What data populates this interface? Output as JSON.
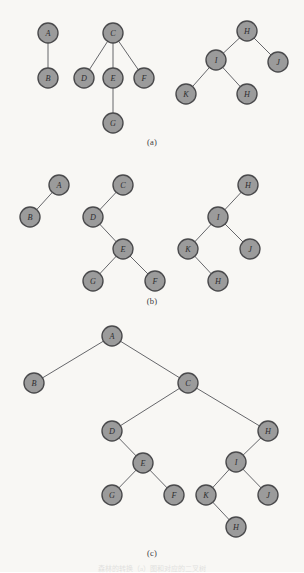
{
  "figure": {
    "background_color": "#f8f7f4",
    "node_fill": "#9b9b9b",
    "node_stroke": "#4a4a4c",
    "edge_color": "#55565a",
    "node_radius": 10,
    "caption_bottom": "森林的转换（a）图和对应的二叉树"
  },
  "panels": [
    {
      "id": "a",
      "caption": "(a)",
      "caption_y": 137,
      "description": "forest of three general trees",
      "trees": [
        {
          "id": "a-tree-1",
          "nodes": [
            {
              "label": "A",
              "x": 48,
              "y": 33
            },
            {
              "label": "B",
              "x": 48,
              "y": 78
            }
          ],
          "edges": [
            [
              0,
              1
            ]
          ]
        },
        {
          "id": "a-tree-2",
          "nodes": [
            {
              "label": "C",
              "x": 113,
              "y": 33
            },
            {
              "label": "D",
              "x": 84,
              "y": 78
            },
            {
              "label": "E",
              "x": 113,
              "y": 78
            },
            {
              "label": "F",
              "x": 144,
              "y": 78
            },
            {
              "label": "G",
              "x": 113,
              "y": 123
            }
          ],
          "edges": [
            [
              0,
              1
            ],
            [
              0,
              2
            ],
            [
              0,
              3
            ],
            [
              2,
              4
            ]
          ]
        },
        {
          "id": "a-tree-3",
          "nodes": [
            {
              "label": "H",
              "x": 247,
              "y": 31
            },
            {
              "label": "I",
              "x": 216,
              "y": 60
            },
            {
              "label": "J",
              "x": 278,
              "y": 62
            },
            {
              "label": "K",
              "x": 186,
              "y": 94
            },
            {
              "label": "H",
              "x": 247,
              "y": 94
            }
          ],
          "edges": [
            [
              0,
              1
            ],
            [
              0,
              2
            ],
            [
              1,
              3
            ],
            [
              1,
              4
            ]
          ]
        }
      ]
    },
    {
      "id": "b",
      "caption": "(b)",
      "caption_y": 296,
      "description": "each tree converted to a binary tree",
      "trees": [
        {
          "id": "b-tree-1",
          "nodes": [
            {
              "label": "A",
              "x": 59,
              "y": 185
            },
            {
              "label": "B",
              "x": 30,
              "y": 217
            }
          ],
          "edges": [
            [
              0,
              1
            ]
          ]
        },
        {
          "id": "b-tree-2",
          "nodes": [
            {
              "label": "C",
              "x": 123,
              "y": 185
            },
            {
              "label": "D",
              "x": 93,
              "y": 217
            },
            {
              "label": "E",
              "x": 123,
              "y": 249
            },
            {
              "label": "G",
              "x": 93,
              "y": 281
            },
            {
              "label": "F",
              "x": 155,
              "y": 281
            }
          ],
          "edges": [
            [
              0,
              1
            ],
            [
              1,
              2
            ],
            [
              2,
              3
            ],
            [
              2,
              4
            ]
          ]
        },
        {
          "id": "b-tree-3",
          "nodes": [
            {
              "label": "H",
              "x": 248,
              "y": 185
            },
            {
              "label": "I",
              "x": 218,
              "y": 217
            },
            {
              "label": "K",
              "x": 188,
              "y": 249
            },
            {
              "label": "J",
              "x": 250,
              "y": 249
            },
            {
              "label": "H",
              "x": 218,
              "y": 281
            }
          ],
          "edges": [
            [
              0,
              1
            ],
            [
              1,
              2
            ],
            [
              1,
              3
            ],
            [
              2,
              4
            ]
          ]
        }
      ]
    },
    {
      "id": "c",
      "caption": "(c)",
      "caption_y": 548,
      "description": "the combined single binary tree",
      "trees": [
        {
          "id": "c-tree-1",
          "nodes": [
            {
              "label": "A",
              "x": 112,
              "y": 336
            },
            {
              "label": "B",
              "x": 34,
              "y": 383
            },
            {
              "label": "C",
              "x": 188,
              "y": 383
            },
            {
              "label": "D",
              "x": 112,
              "y": 431
            },
            {
              "label": "H",
              "x": 268,
              "y": 431
            },
            {
              "label": "E",
              "x": 143,
              "y": 463
            },
            {
              "label": "I",
              "x": 236,
              "y": 462
            },
            {
              "label": "G",
              "x": 112,
              "y": 495
            },
            {
              "label": "F",
              "x": 174,
              "y": 495
            },
            {
              "label": "K",
              "x": 206,
              "y": 495
            },
            {
              "label": "J",
              "x": 268,
              "y": 495
            },
            {
              "label": "H",
              "x": 236,
              "y": 527
            }
          ],
          "edges": [
            [
              0,
              1
            ],
            [
              0,
              2
            ],
            [
              2,
              3
            ],
            [
              2,
              4
            ],
            [
              3,
              5
            ],
            [
              5,
              7
            ],
            [
              5,
              8
            ],
            [
              4,
              6
            ],
            [
              6,
              9
            ],
            [
              6,
              10
            ],
            [
              9,
              11
            ]
          ]
        }
      ]
    }
  ]
}
